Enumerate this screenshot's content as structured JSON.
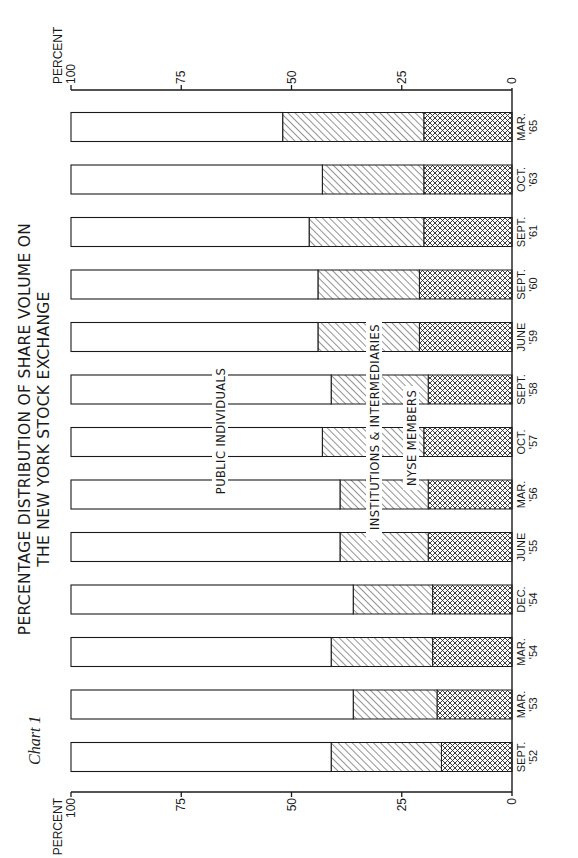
{
  "caption": "Chart 1",
  "title_line1": "PERCENTAGE DISTRIBUTION OF SHARE VOLUME ON",
  "title_line2": "THE NEW YORK STOCK EXCHANGE",
  "axis": {
    "unit_label": "PERCENT",
    "ticks": [
      "100",
      "75",
      "50",
      "25",
      "0"
    ]
  },
  "series_labels": {
    "public": "PUBLIC INDIVIDUALS",
    "institutions": "INSTITUTIONS & INTERMEDIARIES",
    "nyse": "NYSE MEMBERS"
  },
  "colors": {
    "ink": "#1a1a1a",
    "paper": "#ffffff"
  },
  "chart_data": {
    "type": "bar",
    "stacked": true,
    "orientation": "vertical (printed rotated 90° on page)",
    "title": "PERCENTAGE DISTRIBUTION OF SHARE VOLUME ON THE NEW YORK STOCK EXCHANGE",
    "caption": "Chart 1",
    "ylabel": "PERCENT",
    "xlabel": "",
    "ylim": [
      0,
      100
    ],
    "yticks": [
      0,
      25,
      50,
      75,
      100
    ],
    "grid": false,
    "categories": [
      [
        "SEPT.",
        "'52"
      ],
      [
        "MAR.",
        "'53"
      ],
      [
        "MAR.",
        "'54"
      ],
      [
        "DEC.",
        "'54"
      ],
      [
        "JUNE",
        "'55"
      ],
      [
        "MAR.",
        "'56"
      ],
      [
        "OCT.",
        "'57"
      ],
      [
        "SEPT.",
        "'58"
      ],
      [
        "JUNE",
        "'59"
      ],
      [
        "SEPT.",
        "'60"
      ],
      [
        "SEPT.",
        "'61"
      ],
      [
        "OCT.",
        "'63"
      ],
      [
        "MAR.",
        "'65"
      ]
    ],
    "series": [
      {
        "name": "NYSE MEMBERS",
        "pattern": "crosshatch",
        "values": [
          16,
          17,
          18,
          18,
          19,
          19,
          20,
          19,
          21,
          21,
          20,
          20,
          20
        ]
      },
      {
        "name": "INSTITUTIONS & INTERMEDIARIES",
        "pattern": "diagonal",
        "values": [
          25,
          19,
          23,
          18,
          20,
          20,
          23,
          22,
          23,
          23,
          26,
          23,
          32
        ]
      },
      {
        "name": "PUBLIC INDIVIDUALS",
        "pattern": "none",
        "values": [
          59,
          64,
          59,
          64,
          61,
          61,
          57,
          59,
          56,
          56,
          54,
          57,
          48
        ]
      }
    ],
    "cumulative_top_of_institutions": [
      41,
      36,
      41,
      36,
      39,
      39,
      43,
      41,
      44,
      44,
      46,
      43,
      52
    ]
  }
}
